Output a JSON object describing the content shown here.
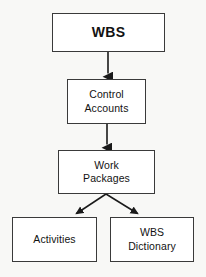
{
  "diagram": {
    "background_color": "#f8f8f6",
    "box_fill_color": "#ffffff",
    "box_border_color": "#3a3a3a",
    "connector_color": "#1a1a1a",
    "nodes": [
      {
        "id": "wbs",
        "label": "WBS",
        "level": 0,
        "x": 52,
        "y": 13,
        "width": 113,
        "height": 39,
        "bold": true
      },
      {
        "id": "control-accounts",
        "label": "Control\nAccounts",
        "level": 1,
        "x": 67,
        "y": 79,
        "width": 79,
        "height": 45,
        "bold": false
      },
      {
        "id": "work-packages",
        "label": "Work\nPackages",
        "level": 2,
        "x": 58,
        "y": 150,
        "width": 97,
        "height": 44,
        "bold": false
      },
      {
        "id": "activities",
        "label": "Activities",
        "level": 3,
        "x": 12,
        "y": 217,
        "width": 85,
        "height": 45,
        "bold": false
      },
      {
        "id": "wbs-dictionary",
        "label": "WBS\nDictionary",
        "level": 3,
        "x": 110,
        "y": 217,
        "width": 84,
        "height": 45,
        "bold": false
      }
    ],
    "connectors": [
      {
        "id": "wbs-to-control-accounts",
        "from": "wbs",
        "to": "control-accounts",
        "kind": "straight-arrow",
        "points": "108,52 108,79"
      },
      {
        "id": "control-accounts-to-work-packages",
        "from": "control-accounts",
        "to": "work-packages",
        "kind": "straight-arrow",
        "points": "107,124 107,150"
      },
      {
        "id": "work-packages-to-activities",
        "from": "work-packages",
        "to": "activities",
        "kind": "diagonal-arrow",
        "points": "106,194 72,217"
      },
      {
        "id": "work-packages-to-wbs-dictionary",
        "from": "work-packages",
        "to": "wbs-dictionary",
        "kind": "diagonal-arrow",
        "points": "106,194 142,217"
      }
    ]
  }
}
